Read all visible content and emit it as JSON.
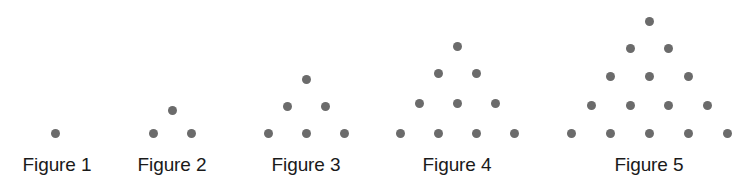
{
  "canvas": {
    "width": 754,
    "height": 194,
    "background": "#ffffff"
  },
  "style": {
    "dot_color": "#6b6b6b",
    "dot_diameter": 9,
    "label_color": "#1a1a1a",
    "label_font_size": 19
  },
  "chart_data": {
    "type": "scatter",
    "title": "",
    "subtitle": "",
    "xlabel": "",
    "ylabel": "",
    "grid": false,
    "legend": null,
    "xlim": [
      0,
      754
    ],
    "ylim": [
      0,
      194
    ],
    "sequence_name": "triangular numbers",
    "dot_counts": [
      1,
      3,
      6,
      10,
      15
    ],
    "row_counts": [
      1,
      2,
      3,
      4,
      5
    ],
    "baseline_y": 133,
    "row_spacing": 27,
    "col_spacing": 38,
    "figures": [
      {
        "label": "Figure 1",
        "rows": 1,
        "dot_count": 1,
        "label_x": 57,
        "label_y": 168,
        "points": [
          {
            "x": 55,
            "y": 133
          }
        ]
      },
      {
        "label": "Figure 2",
        "rows": 2,
        "dot_count": 3,
        "label_x": 172,
        "label_y": 168,
        "points": [
          {
            "x": 172,
            "y": 110
          },
          {
            "x": 153,
            "y": 133
          },
          {
            "x": 191,
            "y": 133
          }
        ]
      },
      {
        "label": "Figure 3",
        "rows": 3,
        "dot_count": 6,
        "label_x": 306,
        "label_y": 168,
        "points": [
          {
            "x": 306,
            "y": 79
          },
          {
            "x": 287,
            "y": 106
          },
          {
            "x": 325,
            "y": 106
          },
          {
            "x": 268,
            "y": 133
          },
          {
            "x": 306,
            "y": 133
          },
          {
            "x": 344,
            "y": 133
          }
        ]
      },
      {
        "label": "Figure 4",
        "rows": 4,
        "dot_count": 10,
        "label_x": 457,
        "label_y": 168,
        "points": [
          {
            "x": 457,
            "y": 46
          },
          {
            "x": 438,
            "y": 73
          },
          {
            "x": 476,
            "y": 73
          },
          {
            "x": 419,
            "y": 103
          },
          {
            "x": 457,
            "y": 103
          },
          {
            "x": 495,
            "y": 103
          },
          {
            "x": 400,
            "y": 133
          },
          {
            "x": 438,
            "y": 133
          },
          {
            "x": 476,
            "y": 133
          },
          {
            "x": 514,
            "y": 133
          }
        ]
      },
      {
        "label": "Figure 5",
        "rows": 5,
        "dot_count": 15,
        "label_x": 649,
        "label_y": 168,
        "points": [
          {
            "x": 649,
            "y": 21
          },
          {
            "x": 630,
            "y": 48
          },
          {
            "x": 668,
            "y": 48
          },
          {
            "x": 610,
            "y": 76
          },
          {
            "x": 649,
            "y": 76
          },
          {
            "x": 688,
            "y": 76
          },
          {
            "x": 591,
            "y": 105
          },
          {
            "x": 630,
            "y": 105
          },
          {
            "x": 668,
            "y": 105
          },
          {
            "x": 707,
            "y": 105
          },
          {
            "x": 571,
            "y": 133
          },
          {
            "x": 610,
            "y": 133
          },
          {
            "x": 649,
            "y": 133
          },
          {
            "x": 688,
            "y": 133
          },
          {
            "x": 727,
            "y": 133
          }
        ]
      }
    ]
  }
}
